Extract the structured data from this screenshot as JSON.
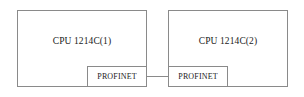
{
  "diagram": {
    "background_color": "#ffffff",
    "line_color": "#8a8a8a",
    "text_color": "#1a1a1a",
    "devices": [
      {
        "id": "cpu-1",
        "label": "CPU 1214C(1)",
        "interface": {
          "id": "profinet-1",
          "label": "PROFINET"
        }
      },
      {
        "id": "cpu-2",
        "label": "CPU 1214C(2)",
        "interface": {
          "id": "profinet-2",
          "label": "PROFINET"
        }
      }
    ],
    "connection": {
      "from": "profinet-1",
      "to": "profinet-2",
      "label": ""
    }
  }
}
